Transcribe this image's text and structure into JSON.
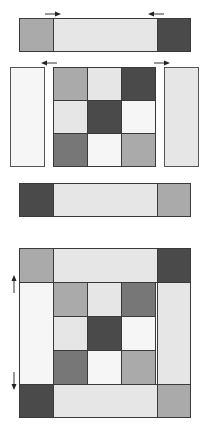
{
  "colors": {
    "dark": "#4a4a4a",
    "mid": "#777777",
    "gray": "#aaaaaa",
    "light": "#e6e6e6",
    "white": "#f6f6f6",
    "stroke": "#3a3a3a"
  },
  "top_strip": {
    "cells": [
      "gray",
      "light",
      "dark"
    ],
    "arrows": [
      {
        "position": "left",
        "direction": "right"
      },
      {
        "position": "right",
        "direction": "left"
      }
    ]
  },
  "middle_section": {
    "left_panel": "white",
    "right_panel": "light",
    "grid": [
      [
        "gray",
        "light",
        "dark"
      ],
      [
        "light",
        "dark",
        "white"
      ],
      [
        "mid",
        "white",
        "gray"
      ]
    ],
    "arrows": [
      {
        "position": "left",
        "direction": "left"
      },
      {
        "position": "right",
        "direction": "right"
      }
    ]
  },
  "bottom_strip": {
    "cells": [
      "dark",
      "light",
      "gray"
    ]
  },
  "assembled_block": {
    "top_row": [
      "gray",
      "light",
      "dark"
    ],
    "left_column": "white",
    "right_column": "light",
    "inner_grid": [
      [
        "gray",
        "light",
        "mid"
      ],
      [
        "light",
        "dark",
        "white"
      ],
      [
        "mid",
        "white",
        "gray"
      ]
    ],
    "bottom_row": [
      "dark",
      "light",
      "gray"
    ],
    "arrows": [
      {
        "position": "upper-left",
        "direction": "up"
      },
      {
        "position": "lower-left",
        "direction": "down"
      }
    ]
  }
}
